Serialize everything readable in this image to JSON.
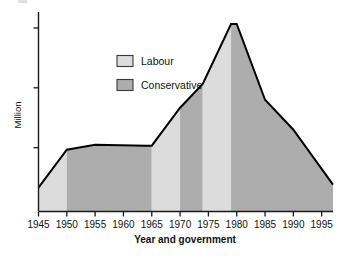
{
  "chart_data": {
    "type": "area",
    "title": "",
    "subtitle": "",
    "xlabel": "Year and government",
    "ylabel": "Million",
    "x_tick_labels": [
      "1945",
      "1950",
      "1955",
      "1960",
      "1965",
      "1970",
      "1975",
      "1980",
      "1985",
      "1990",
      "1995"
    ],
    "x_tick_values": [
      1945,
      1950,
      1955,
      1960,
      1965,
      1970,
      1975,
      1980,
      1985,
      1990,
      1995
    ],
    "xlim": [
      1945,
      1997
    ],
    "ylim": [
      0,
      10
    ],
    "y_tick_count": 3,
    "y_tick_labels": [
      "",
      "",
      ""
    ],
    "y_tick_values": [
      3.2,
      6.2,
      9.2
    ],
    "grid": false,
    "legend_position": "upper-center-left",
    "legend": [
      {
        "name": "Labour",
        "color": "#dcdcdc"
      },
      {
        "name": "Conservative",
        "color": "#adadad"
      }
    ],
    "series_name": "Working days lost / membership",
    "x": [
      1945,
      1950,
      1955,
      1964,
      1965,
      1970,
      1974,
      1979,
      1980,
      1985,
      1990,
      1997
    ],
    "values": [
      1.2,
      3.1,
      3.35,
      3.3,
      3.3,
      5.2,
      6.4,
      9.4,
      9.4,
      5.6,
      4.1,
      1.35
    ],
    "government_bands": [
      {
        "party": "Labour",
        "from": 1945,
        "to": 1950,
        "color": "#dcdcdc"
      },
      {
        "party": "Conservative",
        "from": 1950,
        "to": 1965,
        "color": "#adadad"
      },
      {
        "party": "Labour",
        "from": 1965,
        "to": 1970,
        "color": "#dcdcdc"
      },
      {
        "party": "Conservative",
        "from": 1970,
        "to": 1974,
        "color": "#adadad"
      },
      {
        "party": "Labour",
        "from": 1974,
        "to": 1979,
        "color": "#dcdcdc"
      },
      {
        "party": "Conservative",
        "from": 1979,
        "to": 1997,
        "color": "#adadad"
      }
    ],
    "colors": {
      "labour": "#dcdcdc",
      "conservative": "#adadad",
      "outline": "#000000",
      "axis": "#1a1a1a",
      "text": "#111111",
      "background": "#ffffff"
    }
  }
}
